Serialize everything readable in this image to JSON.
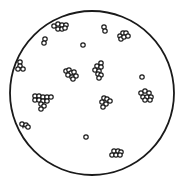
{
  "figure": {
    "width": 184,
    "height": 187,
    "background": "#ffffff",
    "stroke_color": "#1a1a1a",
    "boundary": {
      "cx": 92,
      "cy": 93,
      "r": 82,
      "stroke_width": 1.8
    },
    "marker": {
      "r": 2.2,
      "stroke_width": 1.2,
      "fill": "#ffffff"
    },
    "clusters": [
      {
        "name": "top-edge-cluster",
        "points": [
          [
            54,
            26
          ],
          [
            58,
            24
          ],
          [
            62,
            25
          ],
          [
            66,
            25
          ],
          [
            58,
            29
          ],
          [
            62,
            29
          ],
          [
            65,
            28
          ]
        ]
      },
      {
        "name": "upper-left-pair",
        "points": [
          [
            45,
            39
          ],
          [
            44,
            43
          ]
        ]
      },
      {
        "name": "upper-center-single",
        "points": [
          [
            83,
            45
          ]
        ]
      },
      {
        "name": "top-right-pair",
        "points": [
          [
            104,
            27
          ],
          [
            105,
            31
          ]
        ]
      },
      {
        "name": "top-right-cluster",
        "points": [
          [
            120,
            36
          ],
          [
            123,
            33
          ],
          [
            126,
            33
          ],
          [
            121,
            39
          ],
          [
            124,
            37
          ],
          [
            128,
            36
          ]
        ]
      },
      {
        "name": "left-edge-cluster",
        "points": [
          [
            20,
            62
          ],
          [
            20,
            66
          ],
          [
            18,
            69
          ],
          [
            23,
            69
          ]
        ]
      },
      {
        "name": "center-left-cluster",
        "points": [
          [
            66,
            71
          ],
          [
            69,
            70
          ],
          [
            71,
            73
          ],
          [
            74,
            72
          ],
          [
            68,
            75
          ],
          [
            72,
            77
          ],
          [
            76,
            76
          ],
          [
            73,
            79
          ]
        ]
      },
      {
        "name": "center-cluster",
        "points": [
          [
            101,
            63
          ],
          [
            97,
            66
          ],
          [
            101,
            67
          ],
          [
            95,
            70
          ],
          [
            99,
            71
          ],
          [
            98,
            74
          ],
          [
            101,
            75
          ],
          [
            99,
            78
          ]
        ]
      },
      {
        "name": "right-single",
        "points": [
          [
            142,
            77
          ]
        ]
      },
      {
        "name": "large-left-cluster",
        "points": [
          [
            35,
            96
          ],
          [
            39,
            96
          ],
          [
            43,
            97
          ],
          [
            47,
            97
          ],
          [
            51,
            97
          ],
          [
            35,
            100
          ],
          [
            39,
            100
          ],
          [
            43,
            101
          ],
          [
            47,
            101
          ],
          [
            41,
            104
          ],
          [
            44,
            106
          ],
          [
            41,
            109
          ]
        ]
      },
      {
        "name": "lower-center-cluster",
        "points": [
          [
            104,
            98
          ],
          [
            107,
            99
          ],
          [
            110,
            101
          ],
          [
            102,
            102
          ],
          [
            106,
            104
          ],
          [
            103,
            107
          ]
        ]
      },
      {
        "name": "right-cluster",
        "points": [
          [
            141,
            93
          ],
          [
            145,
            91
          ],
          [
            149,
            93
          ],
          [
            143,
            97
          ],
          [
            147,
            97
          ],
          [
            151,
            97
          ],
          [
            145,
            100
          ],
          [
            150,
            100
          ]
        ]
      },
      {
        "name": "lower-left-edge-cluster",
        "points": [
          [
            22,
            124
          ],
          [
            26,
            125
          ],
          [
            28,
            127
          ]
        ]
      },
      {
        "name": "bottom-single",
        "points": [
          [
            86,
            137
          ]
        ]
      },
      {
        "name": "bottom-cluster",
        "points": [
          [
            114,
            151
          ],
          [
            118,
            151
          ],
          [
            121,
            152
          ],
          [
            112,
            155
          ],
          [
            116,
            155
          ],
          [
            120,
            155
          ]
        ]
      }
    ],
    "filled_wedge": {
      "name": "lower-left-wedge",
      "points": "20,122 25,124 23,129"
    }
  }
}
